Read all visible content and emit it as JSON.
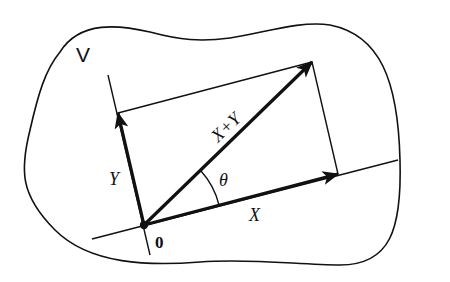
{
  "diagram": {
    "space_label": "V",
    "origin_label": "0",
    "vectors": [
      {
        "name": "X",
        "label": "X"
      },
      {
        "name": "Y",
        "label": "Y"
      },
      {
        "name": "X+Y",
        "label": "X+Y"
      }
    ],
    "angle_label": "θ",
    "colors": {
      "stroke": "#111111",
      "background": "#ffffff"
    }
  }
}
